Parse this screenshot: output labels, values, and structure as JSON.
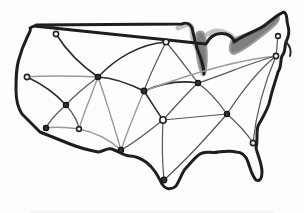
{
  "figure": {
    "title": "",
    "colors": {
      "background": "#fdfdfd",
      "outline": "#1e1e1e",
      "great_lakes": "#6b6b6b",
      "edge_dark": "#2b2b2b",
      "edge_light": "#9a9a9a",
      "node_fill": "#ffffff"
    }
  },
  "nodes": [
    {
      "id": "n1",
      "x": 56,
      "y": 34,
      "style": "open"
    },
    {
      "id": "n2",
      "x": 27,
      "y": 77,
      "style": "open"
    },
    {
      "id": "n3",
      "x": 98,
      "y": 77,
      "style": "filled"
    },
    {
      "id": "n4",
      "x": 166,
      "y": 42,
      "style": "open"
    },
    {
      "id": "n5",
      "x": 66,
      "y": 105,
      "style": "filled"
    },
    {
      "id": "n6",
      "x": 144,
      "y": 91,
      "style": "filled"
    },
    {
      "id": "n7",
      "x": 198,
      "y": 83,
      "style": "filled"
    },
    {
      "id": "n8",
      "x": 278,
      "y": 36,
      "style": "open"
    },
    {
      "id": "n9",
      "x": 276,
      "y": 56,
      "style": "open"
    },
    {
      "id": "n10",
      "x": 46,
      "y": 128,
      "style": "filled"
    },
    {
      "id": "n11",
      "x": 79,
      "y": 129,
      "style": "open"
    },
    {
      "id": "n12",
      "x": 163,
      "y": 120,
      "style": "open"
    },
    {
      "id": "n13",
      "x": 227,
      "y": 114,
      "style": "filled"
    },
    {
      "id": "n14",
      "x": 121,
      "y": 150,
      "style": "filled"
    },
    {
      "id": "n15",
      "x": 253,
      "y": 143,
      "style": "open"
    },
    {
      "id": "n16",
      "x": 164,
      "y": 180,
      "style": "filled"
    }
  ],
  "edges": [
    {
      "from": "n1",
      "to": "n3",
      "weight": "dark"
    },
    {
      "from": "n2",
      "to": "n3",
      "weight": "light"
    },
    {
      "from": "n2",
      "to": "n5",
      "weight": "dark"
    },
    {
      "from": "n3",
      "to": "n4",
      "weight": "dark"
    },
    {
      "from": "n3",
      "to": "n5",
      "weight": "mid"
    },
    {
      "from": "n3",
      "to": "n6",
      "weight": "dark"
    },
    {
      "from": "n3",
      "to": "n11",
      "weight": "light"
    },
    {
      "from": "n3",
      "to": "n14",
      "weight": "light"
    },
    {
      "from": "n4",
      "to": "n6",
      "weight": "mid"
    },
    {
      "from": "n4",
      "to": "n7",
      "weight": "mid"
    },
    {
      "from": "n6",
      "to": "n7",
      "weight": "dark"
    },
    {
      "from": "n6",
      "to": "n12",
      "weight": "dark"
    },
    {
      "from": "n6",
      "to": "n14",
      "weight": "light"
    },
    {
      "from": "n6",
      "to": "n9",
      "weight": "light"
    },
    {
      "from": "n7",
      "to": "n9",
      "weight": "mid"
    },
    {
      "from": "n7",
      "to": "n12",
      "weight": "mid"
    },
    {
      "from": "n7",
      "to": "n13",
      "weight": "mid"
    },
    {
      "from": "n8",
      "to": "n9",
      "weight": "mid"
    },
    {
      "from": "n9",
      "to": "n13",
      "weight": "mid"
    },
    {
      "from": "n9",
      "to": "n15",
      "weight": "mid"
    },
    {
      "from": "n5",
      "to": "n10",
      "weight": "mid"
    },
    {
      "from": "n5",
      "to": "n11",
      "weight": "mid"
    },
    {
      "from": "n10",
      "to": "n11",
      "weight": "light"
    },
    {
      "from": "n11",
      "to": "n14",
      "weight": "light"
    },
    {
      "from": "n12",
      "to": "n13",
      "weight": "mid"
    },
    {
      "from": "n12",
      "to": "n14",
      "weight": "mid"
    },
    {
      "from": "n12",
      "to": "n16",
      "weight": "mid"
    },
    {
      "from": "n13",
      "to": "n15",
      "weight": "mid"
    },
    {
      "from": "n13",
      "to": "n16",
      "weight": "mid"
    }
  ]
}
